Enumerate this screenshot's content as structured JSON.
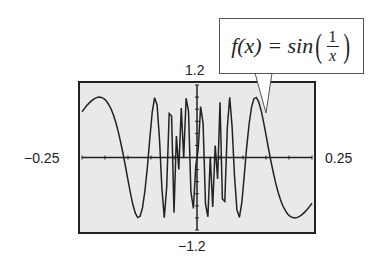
{
  "chart_data": {
    "type": "line",
    "title": "",
    "function_label": {
      "lhs": "f(x) = sin",
      "numerator": "1",
      "denominator": "x"
    },
    "xlabel": "",
    "ylabel": "",
    "xlim": [
      -0.25,
      0.25
    ],
    "ylim": [
      -1.2,
      1.2
    ],
    "tick_labels": {
      "x_min": "−0.25",
      "x_max": "0.25",
      "y_max": "1.2",
      "y_min": "−1.2"
    },
    "grid": false,
    "series": [
      {
        "name": "f(x) = sin(1/x)",
        "function": "sin(1/x)",
        "domain": [
          -0.25,
          0.25
        ]
      }
    ],
    "style": {
      "background": "#e9e9e9",
      "line_color": "#222222"
    }
  }
}
